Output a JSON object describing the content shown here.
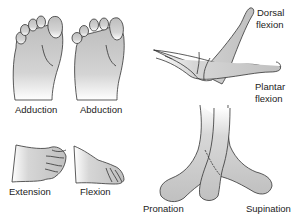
{
  "diagram": {
    "panels": [
      {
        "id": "adduction",
        "label": "Adduction"
      },
      {
        "id": "abduction",
        "label": "Abduction"
      },
      {
        "id": "dorsal-flexion",
        "label_line1": "Dorsal",
        "label_line2": "flexion"
      },
      {
        "id": "plantar-flexion",
        "label_line1": "Plantar",
        "label_line2": "flexion"
      },
      {
        "id": "extension",
        "label": "Extension"
      },
      {
        "id": "flexion",
        "label": "Flexion"
      },
      {
        "id": "pronation",
        "label": "Pronation"
      },
      {
        "id": "supination",
        "label": "Supination"
      }
    ],
    "colors": {
      "skin_fill": "#c4c4c4",
      "skin_fade": "#ffffff",
      "outline": "#333333",
      "text": "#222222"
    }
  }
}
